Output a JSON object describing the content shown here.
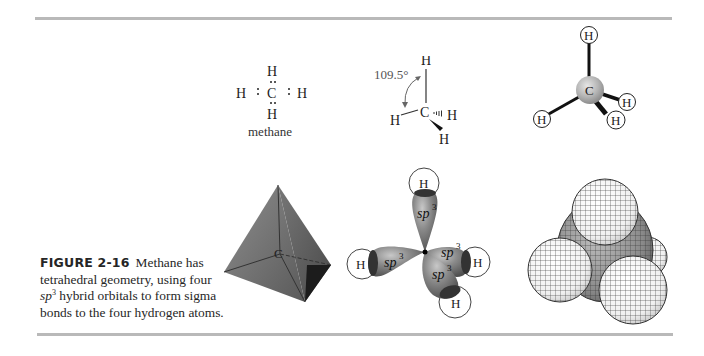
{
  "figure": {
    "number_label": "FIGURE 2-16",
    "caption_lead": "Methane has tetrahedral geometry, using four ",
    "caption_sp": "sp",
    "caption_sup": "3",
    "caption_tail": " hybrid orbitals to form sigma bonds to the four hydrogen atoms."
  },
  "lewis": {
    "atom_top": "H",
    "atom_left": "H",
    "atom_center": "C",
    "atom_right": "H",
    "atom_bottom": "H",
    "name": "methane"
  },
  "wedge": {
    "angle_label": "109.5°",
    "atom_top": "H",
    "atom_left": "H",
    "atom_center": "C",
    "atom_right": "H",
    "atom_bottom": "H"
  },
  "ball_stick": {
    "atom_center": "C",
    "atom_top": "H",
    "atom_left": "H",
    "atom_right": "H",
    "atom_bottom": "H"
  },
  "tetrahedron": {
    "center_label": "C"
  },
  "orbitals": {
    "lobe_label": "sp",
    "lobe_sup": "3",
    "h_top": "H",
    "h_left": "H",
    "h_right": "H",
    "h_bottom": "H"
  },
  "colors": {
    "rule": "#b9b9b9",
    "lobe": "#8a8a8a",
    "lobe_dark": "#4a4a4a",
    "tetra_light": "#9a9a9a",
    "tetra_dark": "#2a2a2a"
  }
}
